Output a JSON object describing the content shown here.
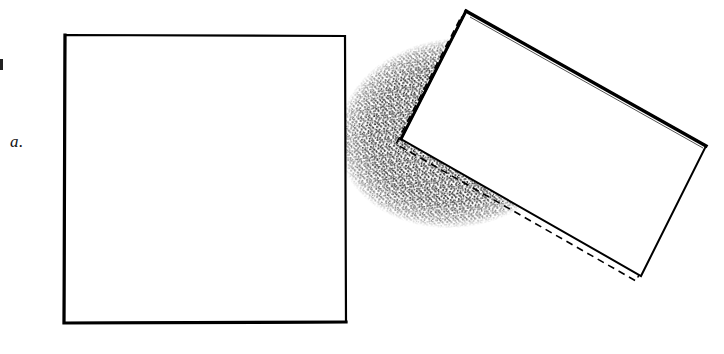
{
  "figure": {
    "panel_label": "a.",
    "caption": "",
    "background_color": "#ffffff",
    "ink_color": "#000000",
    "stipple_color": "#101010",
    "width": 724,
    "height": 354
  },
  "shapes": {
    "square": {
      "name": "front-square",
      "stroke": "#000000",
      "fill": "#ffffff",
      "stroke_width": 2.2,
      "points": "65,35 345,36 346,322 64,323"
    },
    "rotated_rect_solid": {
      "name": "tilted-rectangle",
      "stroke": "#000000",
      "fill": "#ffffff",
      "stroke_width": 2.4,
      "points": "466,11 706,146 641,276 401,139"
    },
    "rotated_rect_dashed": {
      "name": "tilted-rectangle-dashed-outline",
      "stroke": "#000000",
      "fill": "none",
      "stroke_width": 1.6,
      "dash": "7 5",
      "points": "461,17 700,151 636,281 396,144"
    },
    "stipple_blob": {
      "name": "stippled-shadow-blob",
      "shape": "ellipse",
      "cx": 455,
      "cy": 133,
      "rx": 115,
      "ry": 92,
      "rotation_deg": -8
    }
  },
  "marks": {
    "left_margin_mark": {
      "name": "page-edge-mark",
      "color": "#222222"
    }
  }
}
